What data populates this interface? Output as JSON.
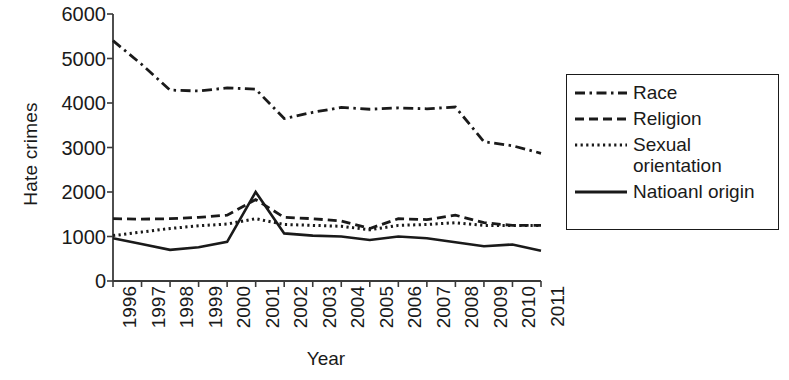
{
  "chart_data": {
    "type": "line",
    "title": "",
    "xlabel": "Year",
    "ylabel": "Hate crimes",
    "categories": [
      "1996",
      "1997",
      "1998",
      "1999",
      "2000",
      "2001",
      "2002",
      "2003",
      "2004",
      "2005",
      "2006",
      "2007",
      "2008",
      "2009",
      "2010",
      "2011"
    ],
    "x": [
      1996,
      1997,
      1998,
      1999,
      2000,
      2001,
      2002,
      2003,
      2004,
      2005,
      2006,
      2007,
      2008,
      2009,
      2010,
      2011
    ],
    "xlim": [
      1996,
      2011
    ],
    "ylim": [
      0,
      6000
    ],
    "yticks": [
      "0",
      "1000",
      "2000",
      "3000",
      "4000",
      "5000",
      "6000"
    ],
    "ytick_values": [
      0,
      1000,
      2000,
      3000,
      4000,
      5000,
      6000
    ],
    "grid": false,
    "legend_position": "right",
    "series": [
      {
        "name": "Race",
        "style": "dashdot",
        "color": "#1a1a1a",
        "values": [
          5400,
          4870,
          4290,
          4270,
          4340,
          4310,
          3650,
          3790,
          3900,
          3860,
          3890,
          3870,
          3910,
          3130,
          3040,
          2870
        ]
      },
      {
        "name": "Religion",
        "style": "dashed",
        "color": "#1a1a1a",
        "values": [
          1400,
          1390,
          1400,
          1430,
          1480,
          1830,
          1430,
          1400,
          1350,
          1180,
          1400,
          1380,
          1480,
          1310,
          1250,
          1250
        ]
      },
      {
        "name": "Sexual\norientation",
        "style": "dotted",
        "color": "#1a1a1a",
        "values": [
          1020,
          1100,
          1180,
          1240,
          1280,
          1400,
          1270,
          1250,
          1230,
          1150,
          1250,
          1270,
          1310,
          1250,
          1250,
          1250
        ]
      },
      {
        "name": "Natioanl origin",
        "style": "solid",
        "color": "#1a1a1a",
        "values": [
          960,
          830,
          700,
          760,
          880,
          2000,
          1070,
          1020,
          1000,
          920,
          1000,
          960,
          870,
          780,
          820,
          680
        ]
      }
    ]
  },
  "axes": {
    "y_title": "Hate crimes",
    "x_title": "Year"
  },
  "legend": {
    "items": [
      {
        "label": "Race",
        "style": "dashdot"
      },
      {
        "label": "Religion",
        "style": "dashed"
      },
      {
        "label": "Sexual\norientation",
        "style": "dotted"
      },
      {
        "label": "Natioanl origin",
        "style": "solid"
      }
    ]
  }
}
